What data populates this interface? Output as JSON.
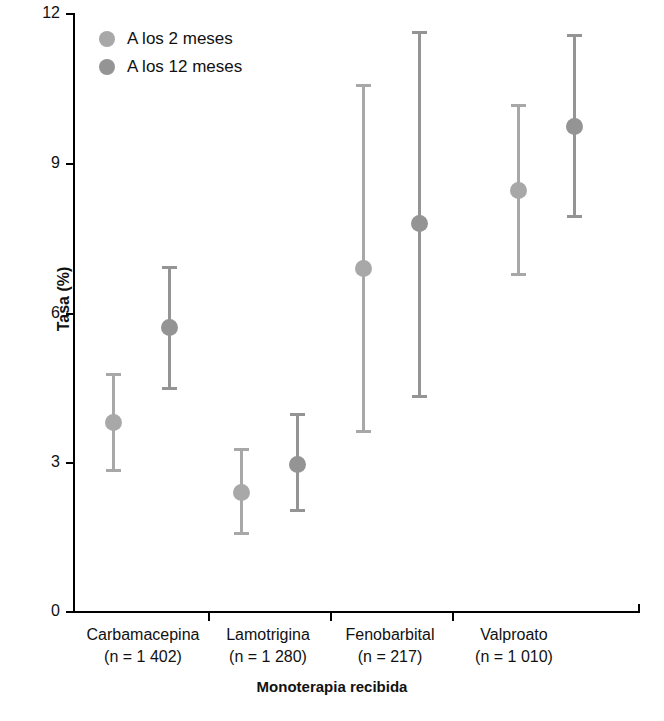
{
  "chart_data": {
    "type": "scatter",
    "title": "",
    "xlabel": "Monoterapia recibida",
    "ylabel": "Tasa (%)",
    "ylim": [
      0,
      12
    ],
    "yticks": [
      0,
      3,
      6,
      9,
      12
    ],
    "ytick_labels": [
      "0",
      "3",
      "6",
      "9",
      "12"
    ],
    "grid": false,
    "legend_position": "top-left",
    "error_bars": "95% CI (vertical ranges with caps)",
    "categories": [
      "Carbamacepina",
      "Lamotrigina",
      "Fenobarbital",
      "Valproato"
    ],
    "category_sublabels": [
      "(n = 1 402)",
      "(n = 1 280)",
      "(n = 217)",
      "(n = 1 010)"
    ],
    "series": [
      {
        "name": "A los 2 meses",
        "color": "#a8a8a8",
        "values": [
          3.8,
          2.4,
          6.9,
          8.45
        ],
        "ci_low": [
          2.8,
          1.55,
          3.6,
          6.75
        ],
        "ci_high": [
          4.8,
          3.3,
          10.6,
          10.2
        ]
      },
      {
        "name": "A los 12 meses",
        "color": "#949494",
        "values": [
          5.7,
          2.95,
          7.8,
          9.75
        ],
        "ci_low": [
          4.45,
          2.0,
          4.3,
          7.9
        ],
        "ci_high": [
          6.95,
          4.0,
          11.65,
          11.6
        ]
      }
    ]
  },
  "legend": {
    "items": [
      {
        "label": "A los 2 meses",
        "color": "#a8a8a8"
      },
      {
        "label": "A los 12 meses",
        "color": "#949494"
      }
    ]
  },
  "axes": {
    "y_title": "Tasa (%)",
    "x_title": "Monoterapia recibida",
    "y_tick_labels": [
      "12",
      "9",
      "6",
      "3",
      "0"
    ]
  },
  "colors": {
    "axis": "#000000",
    "text": "#111111",
    "series_2m": "#a8a8a8",
    "series_12m": "#949494",
    "background": "#ffffff"
  }
}
